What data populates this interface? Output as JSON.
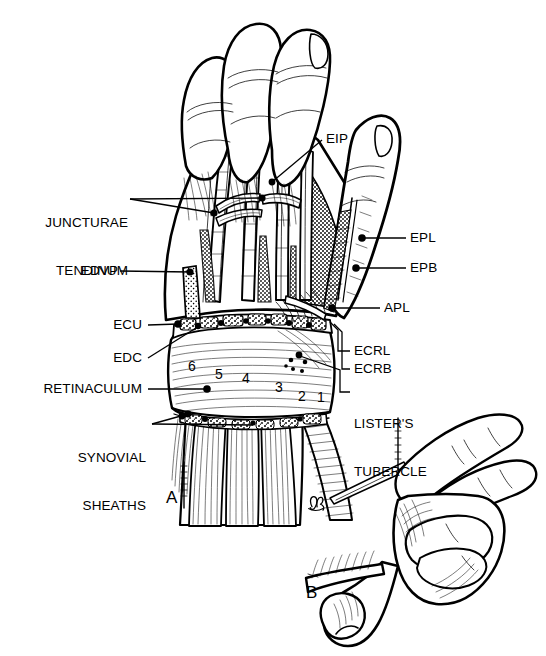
{
  "figure": {
    "panels": [
      {
        "id": "A",
        "label": "A",
        "description": "Dorsal dissection of hand and wrist showing extensor tendons, retinaculum and synovial sheaths"
      },
      {
        "id": "B",
        "label": "B",
        "description": "Lateral view of hand in pinch position"
      }
    ],
    "artist_signature": "monogram"
  },
  "labels": {
    "left": [
      {
        "key": "juncturae",
        "text": "JUNCTURAE\nTENDINUM",
        "line1": "JUNCTURAE",
        "line2": "TENDINUM"
      },
      {
        "key": "edvp",
        "text": "EDVP"
      },
      {
        "key": "ecu",
        "text": "ECU"
      },
      {
        "key": "edc",
        "text": "EDC"
      },
      {
        "key": "retinaculum",
        "text": "RETINACULUM"
      },
      {
        "key": "synovial",
        "text": "SYNOVIAL\nSHEATHS",
        "line1": "SYNOVIAL",
        "line2": "SHEATHS"
      }
    ],
    "right": [
      {
        "key": "eip",
        "text": "EIP"
      },
      {
        "key": "epl",
        "text": "EPL"
      },
      {
        "key": "epb",
        "text": "EPB"
      },
      {
        "key": "apl",
        "text": "APL"
      },
      {
        "key": "ecrl",
        "text": "ECRL"
      },
      {
        "key": "ecrb",
        "text": "ECRB"
      },
      {
        "key": "listers",
        "text": "LISTER'S\nTUBERCLE",
        "line1": "LISTER'S",
        "line2": "TUBERCLE"
      }
    ]
  },
  "compartment_numbers": [
    {
      "n": "6",
      "x": 188,
      "y": 358
    },
    {
      "n": "5",
      "x": 215,
      "y": 366
    },
    {
      "n": "4",
      "x": 242,
      "y": 370
    },
    {
      "n": "3",
      "x": 275,
      "y": 379
    },
    {
      "n": "2",
      "x": 298,
      "y": 388
    },
    {
      "n": "1",
      "x": 317,
      "y": 389
    }
  ],
  "colors": {
    "ink": "#000000",
    "paper": "#ffffff",
    "shade": "#9a9a9a",
    "shade_light": "#c9c9c9"
  }
}
